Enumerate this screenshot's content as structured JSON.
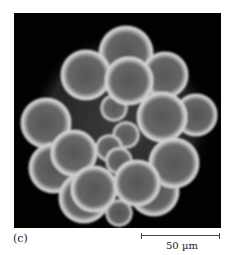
{
  "figure": {
    "panel_label": "(c)",
    "scale_bar_label": "50 µm",
    "image_description": "Fluorescence/phase micrograph of a spherical cluster of cells (embryo, morula stage) on black background",
    "colors": {
      "background": "#020202",
      "cell_membrane": "#e8e8e8",
      "cell_interior": "#6a6a6a"
    }
  }
}
